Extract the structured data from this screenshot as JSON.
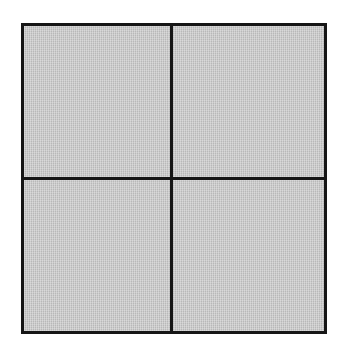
{
  "figure": {
    "canvas": {
      "width": 337,
      "height": 351,
      "background_color": "#ffffff"
    },
    "frame": {
      "x": 21,
      "y": 23,
      "width": 306,
      "height": 311,
      "fill_color": "#c2c2c2",
      "border_color": "#161616",
      "border_width": 3
    },
    "dividers": [
      {
        "name": "vertical-divider",
        "orientation": "vertical",
        "position": 170,
        "thickness": 3,
        "color": "#161616"
      },
      {
        "name": "horizontal-divider",
        "orientation": "horizontal",
        "position": 177,
        "thickness": 3,
        "color": "#161616"
      }
    ],
    "quadrants": [
      {
        "name": "top-left",
        "label": "",
        "contents": "empty"
      },
      {
        "name": "top-right",
        "label": "",
        "contents": "filled-circle"
      },
      {
        "name": "bottom-left",
        "label": "",
        "contents": "open-circle"
      },
      {
        "name": "bottom-right",
        "label": "",
        "contents": "empty"
      }
    ],
    "markers": [
      {
        "name": "filled-circle",
        "quadrant": "top-right",
        "center_x": 246,
        "center_y": 102,
        "diameter": 61,
        "fill_color": "#0d0d0d",
        "outline_color": "#0d0d0d",
        "style": "solid"
      },
      {
        "name": "open-circle",
        "quadrant": "bottom-left",
        "center_x": 96,
        "center_y": 251,
        "diameter": 59,
        "fill_color": "#fdfdfd",
        "outline_color": "#161616",
        "style": "outlined"
      }
    ]
  }
}
